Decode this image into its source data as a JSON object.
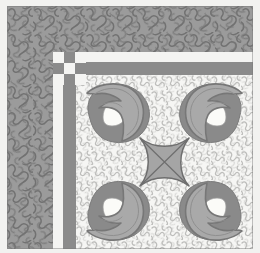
{
  "artwork": {
    "title": "Quilt Corner Block",
    "type": "textile-pattern",
    "description": "Appliqued quilt corner block with stippled background, checkerboard corner, double sashing border and four leaf motifs around a concave-square center medallion",
    "canvas": {
      "width": 260,
      "height": 253
    }
  },
  "palette": {
    "page_background": "#ffffff",
    "outer_margin": "#f2f2f0",
    "outer_border_fill": "#9b9b9b",
    "outer_border_stipple": "#6f6f6f",
    "white_sashing": "#f4f4f2",
    "gray_band": "#8b8b8b",
    "inner_field": "#f6f6f4",
    "inner_field_stipple": "#b9b9b7",
    "motif_light": "#a9a9a9",
    "motif_dark": "#8a8a8a",
    "motif_outline": "#777777",
    "motif_highlight": "#fbfbf8",
    "medallion_fill": "#a5a5a5",
    "medallion_line": "#6e6e6e"
  },
  "regions": {
    "outer_border": {
      "label": "Outer stippled border",
      "x": 7,
      "y": 6,
      "width": 246,
      "height": 243
    },
    "white_sashing": {
      "label": "White sashing strip",
      "x": 53,
      "y": 52,
      "width": 200,
      "height": 197
    },
    "gray_band": {
      "label": "Gray sashing band",
      "x": 63,
      "y": 62,
      "width": 190,
      "height": 187
    },
    "inner_field": {
      "label": "Inner stippled field",
      "x": 76,
      "y": 75,
      "width": 177,
      "height": 174
    }
  },
  "corner_checkerboard": {
    "label": "Corner checkerboard",
    "rows": 3,
    "cols": 3,
    "cells": [
      "l",
      "d",
      "l",
      "d",
      "l",
      "d",
      "l",
      "d",
      "l"
    ]
  },
  "motifs": {
    "label": "Leaf appliqué motifs",
    "count": 4,
    "positions": [
      "top-left",
      "top-right",
      "bottom-left",
      "bottom-right"
    ],
    "highlight_label": "white petal highlight"
  },
  "medallion": {
    "label": "Center medallion",
    "shape": "concave-sided square",
    "cross": "diagonal X",
    "center_x": 166,
    "center_y": 162,
    "radius": 26
  }
}
